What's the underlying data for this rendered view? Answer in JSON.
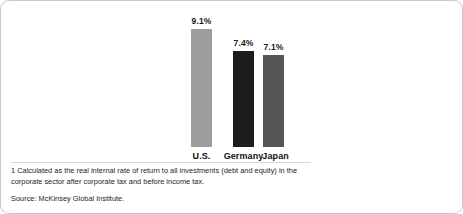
{
  "chart_data": {
    "type": "bar",
    "title": "",
    "subtitle": "",
    "xlabel": "",
    "ylabel": "",
    "ylim": [
      0,
      9.1
    ],
    "grid": false,
    "legend": "none",
    "unit": "%",
    "categories": [
      "U.S.",
      "Germany",
      "Japan"
    ],
    "values": [
      9.1,
      7.4,
      7.1
    ],
    "value_labels": [
      "9.1%",
      "7.4%",
      "7.1%"
    ],
    "bar_colors": [
      "#9d9d9d",
      "#1c1c1c",
      "#555555"
    ],
    "series": [
      {
        "name": "Real internal rate of return",
        "values": [
          9.1,
          7.4,
          7.1
        ]
      }
    ]
  },
  "notes": {
    "footnote": "1  Calculated as the real internal rate of return to all investments (debt and equity) in the corporate sector after corporate tax and before income tax.",
    "source": "Source: McKinsey Global Institute."
  },
  "colors": {
    "border": "#c8c8c8",
    "background": "#ffffff",
    "text": "#1d1d1d",
    "divider": "#d9d9d9"
  }
}
